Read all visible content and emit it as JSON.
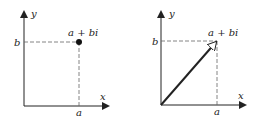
{
  "diagrams": [
    {
      "name": "point-representation",
      "x_axis_label": "x",
      "y_axis_label": "y",
      "point_label": "a + bi",
      "x_tick_label": "a",
      "y_tick_label": "b",
      "marker": "dot"
    },
    {
      "name": "vector-representation",
      "x_axis_label": "x",
      "y_axis_label": "y",
      "point_label": "a + bi",
      "x_tick_label": "a",
      "y_tick_label": "b",
      "marker": "arrow"
    }
  ],
  "colors": {
    "ink": "#222222",
    "dash": "#666666",
    "background": "#ffffff"
  }
}
